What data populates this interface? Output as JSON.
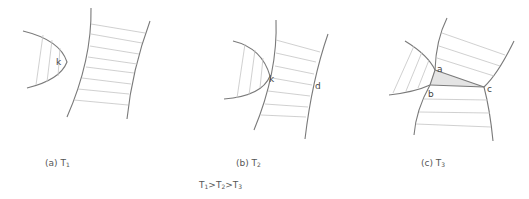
{
  "panels": [
    {
      "id": "a",
      "caption_prefix": "(a) T",
      "caption_sub": "1",
      "points": [
        "k"
      ]
    },
    {
      "id": "b",
      "caption_prefix": "(b) T",
      "caption_sub": "2",
      "points": [
        "k",
        "d"
      ]
    },
    {
      "id": "c",
      "caption_prefix": "(c) T",
      "caption_sub": "3",
      "points": [
        "a",
        "b",
        "c"
      ]
    }
  ],
  "relation": {
    "t1": "T",
    "s1": "1",
    "gt1": ">",
    "t2": "T",
    "s2": "2",
    "gt2": ">",
    "t3": "T",
    "s3": "3"
  },
  "colors": {
    "outline": "#7a7a7a",
    "hatch": "#c4c4c4",
    "shaded_triangle": "#e4e4e4",
    "text": "#444444"
  }
}
